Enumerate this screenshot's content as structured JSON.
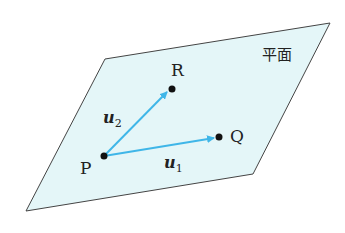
{
  "diagram": {
    "plane_label": "平面",
    "points": {
      "P": {
        "label": "P"
      },
      "Q": {
        "label": "Q"
      },
      "R": {
        "label": "R"
      }
    },
    "vectors": {
      "u1": {
        "base": "u",
        "sub": "1"
      },
      "u2": {
        "base": "u",
        "sub": "2"
      }
    },
    "colors": {
      "plane_fill": "#e4f6f8",
      "plane_stroke": "#444444",
      "arrow": "#3fb6e8",
      "point": "#111111"
    }
  }
}
